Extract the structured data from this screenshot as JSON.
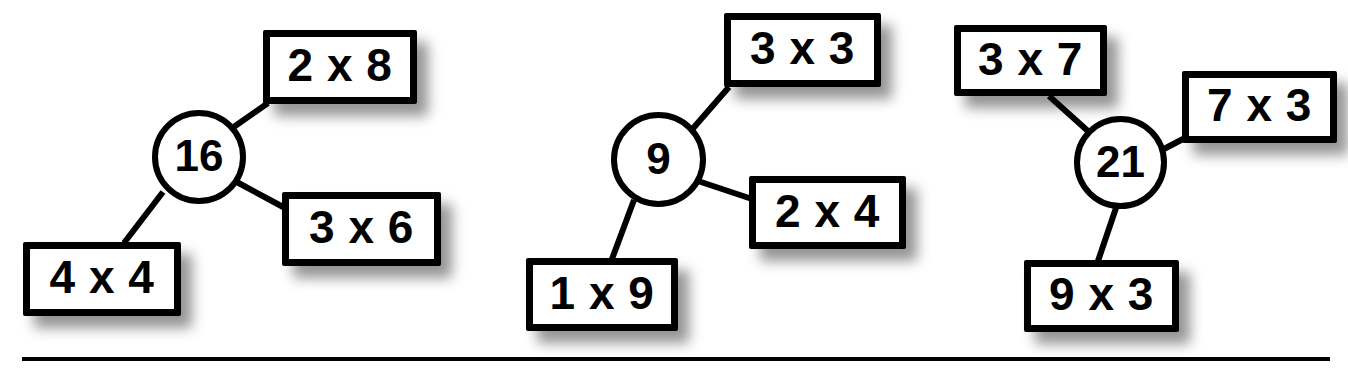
{
  "worksheet": {
    "title": "Multiplication fact family clusters",
    "background_color": "#ffffff",
    "ink_color": "#000000",
    "baseline_rule": {
      "label": "horizontal-rule",
      "x": 22,
      "y": 357,
      "width": 1308,
      "height": 4
    }
  },
  "clusters": [
    {
      "id": "cluster-16",
      "center": {
        "label": "16",
        "shape": "circle",
        "x": 152,
        "y": 110,
        "size": 94
      },
      "facts": [
        {
          "label": "2 x 8",
          "position": "upper-right",
          "x": 263,
          "y": 30,
          "width": 154,
          "height": 74
        },
        {
          "label": "3 x 6",
          "position": "lower-right",
          "x": 282,
          "y": 192,
          "width": 159,
          "height": 74
        },
        {
          "label": "4 x 4",
          "position": "lower-left",
          "x": 23,
          "y": 242,
          "width": 158,
          "height": 74
        }
      ],
      "edges": [
        {
          "from": "16",
          "to": "2 x 8",
          "x1": 228,
          "y1": 131,
          "x2": 268,
          "y2": 103
        },
        {
          "from": "16",
          "to": "3 x 6",
          "x1": 233,
          "y1": 180,
          "x2": 285,
          "y2": 208
        },
        {
          "from": "16",
          "to": "4 x 4",
          "x1": 163,
          "y1": 192,
          "x2": 124,
          "y2": 243
        }
      ]
    },
    {
      "id": "cluster-9",
      "center": {
        "label": "9",
        "shape": "circle",
        "x": 611,
        "y": 112,
        "size": 95
      },
      "facts": [
        {
          "label": "3 x 3",
          "position": "upper-right",
          "x": 724,
          "y": 13,
          "width": 157,
          "height": 74
        },
        {
          "label": "2 x 4",
          "position": "lower-right",
          "x": 749,
          "y": 176,
          "width": 157,
          "height": 73
        },
        {
          "label": "1 x 9",
          "position": "lower-left",
          "x": 526,
          "y": 258,
          "width": 152,
          "height": 73
        }
      ],
      "edges": [
        {
          "from": "9",
          "to": "3 x 3",
          "x1": 689,
          "y1": 133,
          "x2": 729,
          "y2": 87
        },
        {
          "from": "9",
          "to": "2 x 4",
          "x1": 695,
          "y1": 180,
          "x2": 752,
          "y2": 199
        },
        {
          "from": "9",
          "to": "1 x 9",
          "x1": 634,
          "y1": 200,
          "x2": 612,
          "y2": 259
        }
      ]
    },
    {
      "id": "cluster-21",
      "center": {
        "label": "21",
        "shape": "circle",
        "x": 1074,
        "y": 116,
        "size": 93
      },
      "facts": [
        {
          "label": "3 x 7",
          "position": "upper-left",
          "x": 954,
          "y": 25,
          "width": 153,
          "height": 71
        },
        {
          "label": "7 x 3",
          "position": "right",
          "x": 1182,
          "y": 71,
          "width": 155,
          "height": 72
        },
        {
          "label": "9 x 3",
          "position": "bottom",
          "x": 1024,
          "y": 260,
          "width": 155,
          "height": 72
        }
      ],
      "edges": [
        {
          "from": "21",
          "to": "3 x 7",
          "x1": 1089,
          "y1": 132,
          "x2": 1049,
          "y2": 96
        },
        {
          "from": "21",
          "to": "7 x 3",
          "x1": 1160,
          "y1": 151,
          "x2": 1185,
          "y2": 138
        },
        {
          "from": "21",
          "to": "9 x 3",
          "x1": 1116,
          "y1": 208,
          "x2": 1098,
          "y2": 261
        }
      ]
    }
  ]
}
